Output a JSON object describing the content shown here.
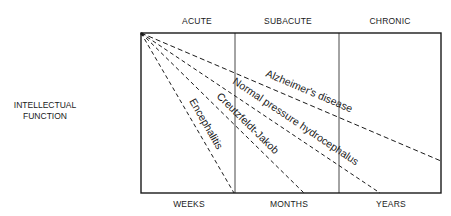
{
  "diagram": {
    "type": "onset-vs-decline diagram",
    "y_axis_label": [
      "INTELLECTUAL",
      "FUNCTION"
    ],
    "top_phases": [
      {
        "label": "ACUTE",
        "x": 197
      },
      {
        "label": "SUBACUTE",
        "x": 287
      },
      {
        "label": "CHRONIC",
        "x": 390
      }
    ],
    "bottom_timescale": [
      {
        "label": "WEEKS",
        "x": 190
      },
      {
        "label": "MONTHS",
        "x": 287
      },
      {
        "label": "YEARS",
        "x": 390
      }
    ],
    "frame": {
      "x1": 141,
      "y1": 33,
      "x2": 441,
      "y2": 193,
      "dividers_x": [
        235,
        339
      ]
    },
    "origin": {
      "x": 141,
      "y": 33
    },
    "curves": [
      {
        "label": "Encephalitis",
        "end": {
          "x": 234,
          "y": 193
        },
        "style": "dashed"
      },
      {
        "label": "Creutzfeldt-Jakob",
        "end": {
          "x": 304,
          "y": 193
        },
        "style": "dashed"
      },
      {
        "label": "Normal pressure hydrocephalus",
        "end": {
          "x": 380,
          "y": 193
        },
        "style": "dashed"
      },
      {
        "label": "Alzheimer's disease",
        "end": {
          "x": 441,
          "y": 161
        },
        "style": "dashed"
      }
    ],
    "colors": {
      "ink": "#1a1a1a",
      "background": "#ffffff"
    }
  }
}
